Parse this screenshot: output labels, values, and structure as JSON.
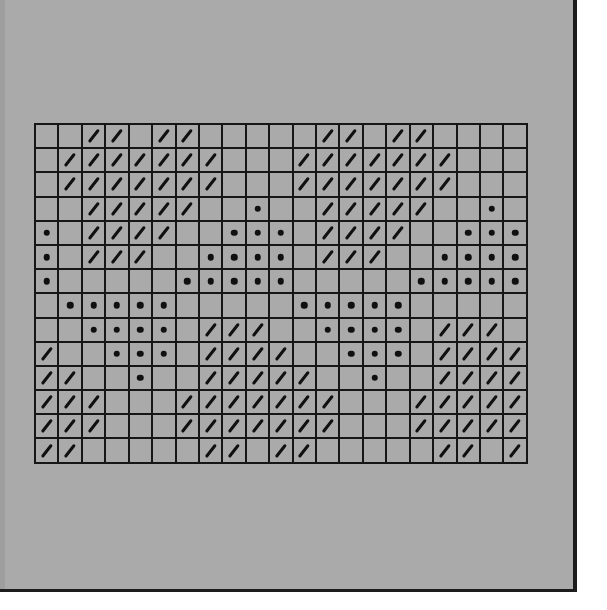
{
  "chart_title": "",
  "legend": {
    "slash": "diagonal-stitch-symbol",
    "dot": "dot-stitch-symbol",
    "empty": "blank-square"
  },
  "colors": {
    "background": "#aaaaaa",
    "grid_line": "#161616",
    "symbol": "#101010",
    "outer": "#ffffff"
  },
  "grid": {
    "columns": 21,
    "rows": 14,
    "encoding": "'/' = slash, '.' = dot, '-' = empty",
    "cells": [
      "--//-//-----//-//----",
      "-///////---///////---",
      "-///////---///////---",
      "--/////--.--/////--.-",
      ".-////--...-////--...",
      ".-///--....-///--....",
      ".-----.....-----.....",
      "-.....-----.....-----",
      "--....-///--....-///-",
      "/--...-////--...-////",
      "//--.--/////--.--////",
      "///---///////---/////",
      "///---///////---/////",
      "//-----//-//-----//-/"
    ]
  },
  "chart_data": {
    "type": "heatmap",
    "title": "",
    "xlabel": "",
    "ylabel": "",
    "categories_x": [
      1,
      2,
      3,
      4,
      5,
      6,
      7,
      8,
      9,
      10,
      11,
      12,
      13,
      14,
      15,
      16,
      17,
      18,
      19,
      20,
      21
    ],
    "categories_y": [
      1,
      2,
      3,
      4,
      5,
      6,
      7,
      8,
      9,
      10,
      11,
      12,
      13,
      14
    ],
    "value_key": {
      "slash": "/",
      "dot": ".",
      "empty": "-"
    },
    "rows": [
      "--//-//-----//-//----",
      "-///////---///////---",
      "-///////---///////---",
      "--/////--.--/////--.-",
      ".-////--...-////--...",
      ".-///--....-///--....",
      ".-----.....-----.....",
      "-.....-----.....-----",
      "--....-///--....-///-",
      "/--...-////--...-////",
      "//--.--/////--.--////",
      "///---///////---/////",
      "///---///////---/////",
      "//-----//-//-----//-/"
    ],
    "grid": true,
    "legend_position": "none"
  }
}
